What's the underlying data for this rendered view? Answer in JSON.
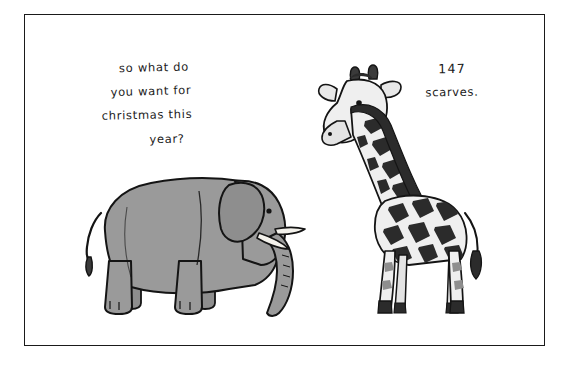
{
  "cartoon": {
    "background_color": "#ffffff",
    "frame": {
      "name": "panel-border",
      "color": "#1a1a1a"
    },
    "elephant": {
      "label": "elephant",
      "body_color": "#9a9a9a",
      "outline_color": "#141414",
      "tusk_color": "#f2f0ea",
      "speech": {
        "line1": "so what do",
        "line2": "you want for",
        "line3": "christmas this",
        "line4": "year?"
      }
    },
    "giraffe": {
      "label": "giraffe",
      "body_color": "#ededed",
      "spot_color": "#2b2b2b",
      "outline_color": "#141414",
      "speech": {
        "line1": "147",
        "line2": "scarves."
      }
    }
  }
}
